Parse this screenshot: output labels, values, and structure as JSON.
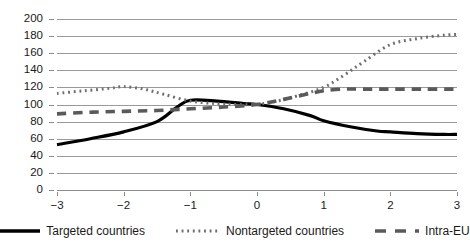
{
  "chart_data": {
    "type": "line",
    "title": "",
    "subtitle": "",
    "xlabel": "",
    "ylabel": "",
    "xlim": [
      -3,
      3
    ],
    "ylim": [
      0,
      200
    ],
    "grid": true,
    "grid_axis": "y",
    "legend_position": "bottom",
    "x": [
      -3,
      -2,
      -1,
      0,
      1,
      2,
      3
    ],
    "x_tick_labels": [
      "−3",
      "−2",
      "−1",
      "0",
      "1",
      "2",
      "3"
    ],
    "y_ticks": [
      0,
      20,
      40,
      60,
      80,
      100,
      120,
      140,
      160,
      180,
      200
    ],
    "y_tick_labels": [
      "0",
      "20",
      "40",
      "60",
      "80",
      "100",
      "120",
      "140",
      "160",
      "180",
      "200"
    ],
    "series": [
      {
        "name": "Targeted countries",
        "style": "solid",
        "color": "#000000",
        "width": 3.2,
        "values": [
          53,
          68,
          105,
          100,
          81,
          68,
          65
        ],
        "dense_x": [
          -3,
          -2.5,
          -2,
          -1.5,
          -1.2,
          -1,
          -0.6,
          -0.2,
          0,
          0.4,
          0.8,
          1,
          1.4,
          1.8,
          2,
          2.4,
          2.8,
          3
        ],
        "dense_y": [
          53,
          60,
          68,
          80,
          97,
          105,
          104,
          101,
          100,
          95,
          87,
          81,
          74,
          69,
          68,
          66,
          65,
          65
        ]
      },
      {
        "name": "Nontargeted countries",
        "style": "dotted",
        "color": "#6e6e6e",
        "width": 3.0,
        "values": [
          113,
          121,
          104,
          100,
          120,
          170,
          182
        ],
        "dense_x": [
          -3,
          -2.6,
          -2.2,
          -2,
          -1.7,
          -1.4,
          -1,
          -0.6,
          -0.3,
          0,
          0.3,
          0.6,
          1,
          1.3,
          1.6,
          2,
          2.4,
          2.8,
          3
        ],
        "dense_y": [
          113,
          116,
          119,
          121,
          118,
          112,
          104,
          101,
          100,
          100,
          104,
          110,
          120,
          134,
          150,
          170,
          177,
          181,
          182
        ]
      },
      {
        "name": "Intra-EU",
        "style": "dashed",
        "color": "#5a5a5a",
        "width": 3.6,
        "values": [
          89,
          92,
          95,
          100,
          117,
          118,
          118
        ],
        "dense_x": [
          -3,
          -2.5,
          -2,
          -1.5,
          -1,
          -0.5,
          0,
          0.4,
          0.8,
          1,
          1.3,
          1.6,
          2,
          2.5,
          3
        ],
        "dense_y": [
          89,
          91,
          92,
          93,
          95,
          97,
          100,
          106,
          113,
          116,
          118,
          118,
          118,
          118,
          118
        ]
      }
    ]
  },
  "legend": {
    "items": [
      {
        "label": "Targeted countries",
        "style": "solid",
        "color": "#000000"
      },
      {
        "label": "Nontargeted countries",
        "style": "dotted",
        "color": "#6e6e6e"
      },
      {
        "label": "Intra-EU",
        "style": "dashed",
        "color": "#5a5a5a"
      }
    ]
  }
}
